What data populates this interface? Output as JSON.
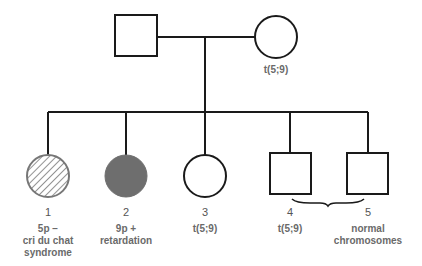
{
  "diagram": {
    "type": "pedigree",
    "colors": {
      "line": "#1a1a1a",
      "affected_fill": "#6e6e6e",
      "hatch": "#777777",
      "text": "#6a6a6a"
    },
    "parents": {
      "father": {
        "shape": "square",
        "label": ""
      },
      "mother": {
        "shape": "circle",
        "label": "t(5;9)"
      }
    },
    "children": [
      {
        "number": "1",
        "shape": "circle",
        "fill": "hatched",
        "label_line1": "5p −",
        "label_line2": "cri du chat",
        "label_line3": "syndrome"
      },
      {
        "number": "2",
        "shape": "circle",
        "fill": "solid",
        "label_line1": "9p +",
        "label_line2": "retardation"
      },
      {
        "number": "3",
        "shape": "circle",
        "fill": "none",
        "label_line1": "t(5;9)"
      },
      {
        "number": "4",
        "shape": "square",
        "fill": "none",
        "label_line1": "t(5;9)"
      },
      {
        "number": "5",
        "shape": "square",
        "fill": "none",
        "label_line1": "normal",
        "label_line2": "chromosomes"
      }
    ],
    "brace": "between 4 and 5"
  }
}
